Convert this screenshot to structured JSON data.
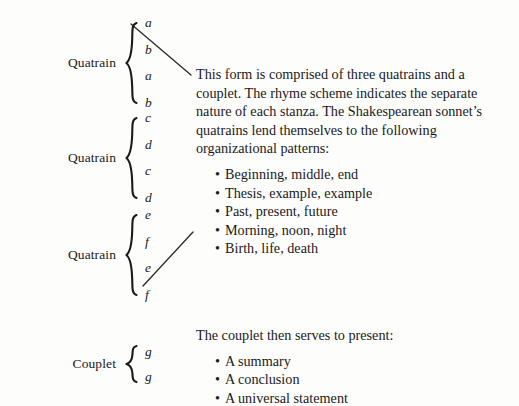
{
  "diagram": {
    "text_color": "#1a1a1a",
    "background_color": "#fdfdfc",
    "line_color": "#2b2b2b"
  },
  "stanzas": [
    {
      "id": "quatrain-1",
      "label": "Quatrain",
      "brace": "{",
      "rhymes": [
        "a",
        "b",
        "a",
        "b"
      ]
    },
    {
      "id": "quatrain-2",
      "label": "Quatrain",
      "brace": "{",
      "rhymes": [
        "c",
        "d",
        "c",
        "d"
      ]
    },
    {
      "id": "quatrain-3",
      "label": "Quatrain",
      "brace": "{",
      "rhymes": [
        "e",
        "f",
        "e",
        "f"
      ]
    },
    {
      "id": "couplet",
      "label": "Couplet",
      "brace": "{",
      "rhymes": [
        "g",
        "g"
      ]
    }
  ],
  "quatrain_note": {
    "paragraph": "This form is comprised of three quatrains and a couplet. The rhyme scheme indicates the separate nature of each stanza. The Shakespearean sonnet’s quatrains lend themselves to the following organizational patterns:",
    "bullet_marker": "•",
    "bullets": [
      "Beginning, middle, end",
      "Thesis, example, example",
      "Past, present, future",
      "Morning, noon, night",
      "Birth, life, death"
    ]
  },
  "couplet_note": {
    "paragraph": "The couplet then serves to present:",
    "bullet_marker": "•",
    "bullets": [
      "A summary",
      "A conclusion",
      "A universal statement"
    ]
  }
}
